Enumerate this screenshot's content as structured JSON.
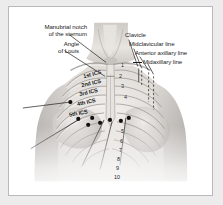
{
  "figure": {
    "frame_color": "#b9b9bb",
    "background": "#ffffff",
    "page_background": "#ececed",
    "line_color": "#1b1b1b",
    "marker_color": "#111111"
  },
  "labels": {
    "left": [
      {
        "id": "manubrial-notch",
        "line1": "Manubrial notch",
        "line2": "of the sternum"
      },
      {
        "id": "angle-of-louis",
        "line1": "Angle",
        "line2": "of Louis"
      }
    ],
    "right": [
      {
        "id": "clavicle",
        "text": "Clavicle"
      },
      {
        "id": "midclavicular-line",
        "text": "Midclavicular line"
      },
      {
        "id": "anterior-axillary-line",
        "text": "Anterior axillary line"
      },
      {
        "id": "midaxillary-line",
        "text": "Midaxillary line"
      }
    ]
  },
  "intercostal_spaces": [
    {
      "id": "ics-1",
      "text": "1st ICS"
    },
    {
      "id": "ics-2",
      "text": "2nd ICS"
    },
    {
      "id": "ics-3",
      "text": "3rd ICS"
    },
    {
      "id": "ics-4",
      "text": "4th ICS"
    },
    {
      "id": "ics-5",
      "text": "5th ICS"
    }
  ],
  "rib_numbers": {
    "upper": [
      "1",
      "2",
      "3",
      "4"
    ],
    "lower": [
      "5",
      "6",
      "7",
      "8",
      "9",
      "10"
    ]
  }
}
